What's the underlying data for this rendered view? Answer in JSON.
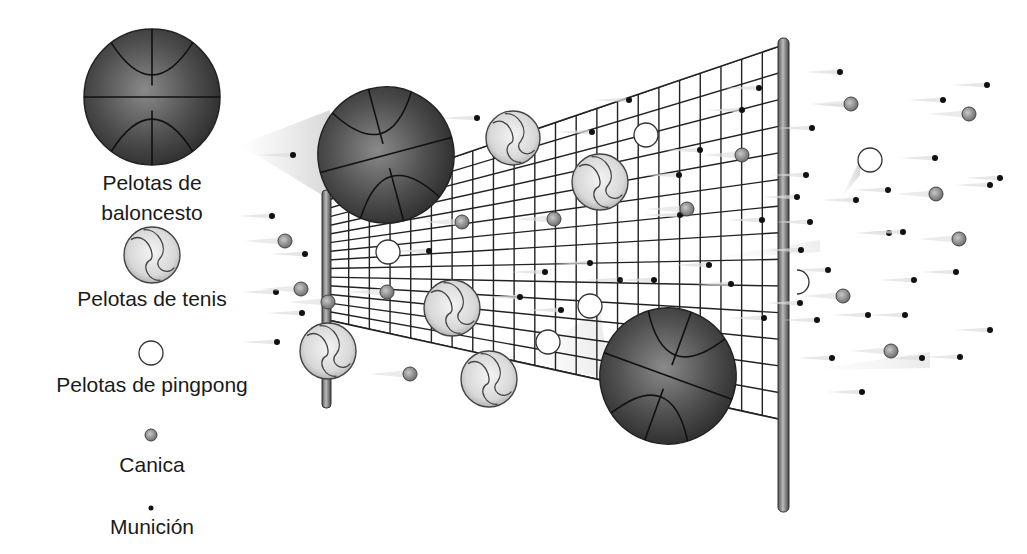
{
  "legend": {
    "basketball": "Pelotas de baloncesto",
    "basketball_line1": "Pelotas de",
    "basketball_line2": "baloncesto",
    "tennis": "Pelotas de tenis",
    "pingpong": "Pelotas de pingpong",
    "marble": "Canica",
    "shot": "Munición"
  },
  "colors": {
    "basketball": "#4a4a4a",
    "marble": "#8a8a8a",
    "shot": "#111111",
    "net": "#222222",
    "pole": "#777777"
  }
}
